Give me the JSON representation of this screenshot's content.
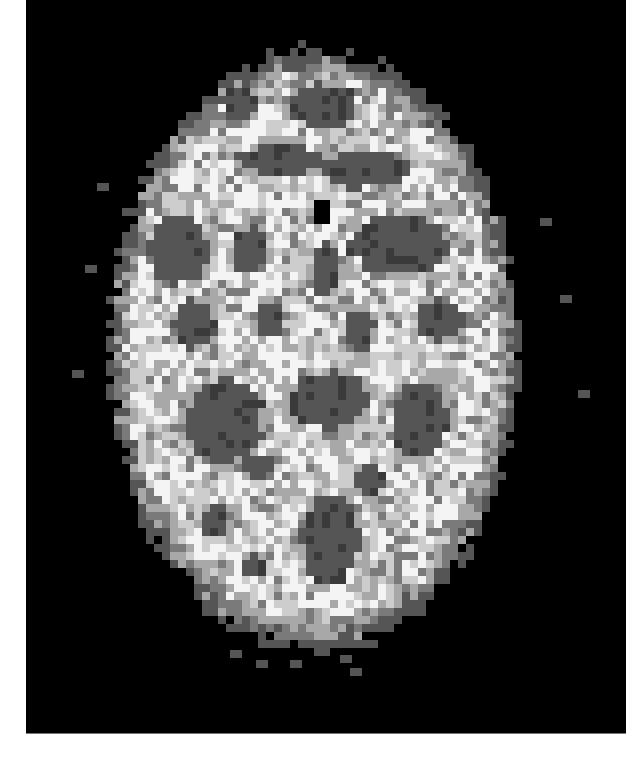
{
  "image": {
    "description": "Axial brain PET scan, grayscale, pixelated",
    "frame": {
      "x": 26,
      "y": 0,
      "width": 600,
      "height": 733,
      "background": "#000000"
    },
    "page_background": "#ffffff",
    "cell_size": 8,
    "palette": {
      "0": "#000000",
      "1": "#3a3a3a",
      "2": "#555555",
      "3": "#7a7a7a",
      "4": "#a8a8a8",
      "5": "#cdcdcd",
      "6": "#f4f4f4"
    },
    "brain_ellipse": {
      "cx": 314,
      "cy": 350,
      "rx": 205,
      "ry": 300
    },
    "dark_regions": [
      {
        "cx": 240,
        "cy": 103,
        "rx": 18,
        "ry": 16
      },
      {
        "cx": 322,
        "cy": 105,
        "rx": 34,
        "ry": 22
      },
      {
        "cx": 280,
        "cy": 160,
        "rx": 45,
        "ry": 14
      },
      {
        "cx": 365,
        "cy": 170,
        "rx": 45,
        "ry": 18
      },
      {
        "cx": 322,
        "cy": 212,
        "rx": 10,
        "ry": 10,
        "level": 0
      },
      {
        "cx": 180,
        "cy": 250,
        "rx": 30,
        "ry": 35
      },
      {
        "cx": 250,
        "cy": 250,
        "rx": 18,
        "ry": 22
      },
      {
        "cx": 325,
        "cy": 270,
        "rx": 14,
        "ry": 25
      },
      {
        "cx": 400,
        "cy": 245,
        "rx": 50,
        "ry": 30
      },
      {
        "cx": 270,
        "cy": 320,
        "rx": 14,
        "ry": 20
      },
      {
        "cx": 360,
        "cy": 330,
        "rx": 14,
        "ry": 22
      },
      {
        "cx": 195,
        "cy": 325,
        "rx": 20,
        "ry": 25
      },
      {
        "cx": 440,
        "cy": 320,
        "rx": 25,
        "ry": 20
      },
      {
        "cx": 225,
        "cy": 420,
        "rx": 38,
        "ry": 42
      },
      {
        "cx": 328,
        "cy": 400,
        "rx": 40,
        "ry": 28
      },
      {
        "cx": 420,
        "cy": 420,
        "rx": 28,
        "ry": 38
      },
      {
        "cx": 215,
        "cy": 520,
        "rx": 15,
        "ry": 15
      },
      {
        "cx": 330,
        "cy": 540,
        "rx": 30,
        "ry": 45
      },
      {
        "cx": 260,
        "cy": 465,
        "rx": 15,
        "ry": 12
      },
      {
        "cx": 370,
        "cy": 480,
        "rx": 14,
        "ry": 18
      },
      {
        "cx": 255,
        "cy": 565,
        "rx": 12,
        "ry": 10
      }
    ],
    "outer_speckles": [
      {
        "x": 97,
        "y": 183
      },
      {
        "x": 85,
        "y": 265
      },
      {
        "x": 540,
        "y": 218
      },
      {
        "x": 560,
        "y": 295
      },
      {
        "x": 578,
        "y": 390
      },
      {
        "x": 72,
        "y": 370
      },
      {
        "x": 230,
        "y": 650
      },
      {
        "x": 256,
        "y": 660
      },
      {
        "x": 290,
        "y": 660
      },
      {
        "x": 340,
        "y": 655
      },
      {
        "x": 350,
        "y": 668
      }
    ]
  }
}
